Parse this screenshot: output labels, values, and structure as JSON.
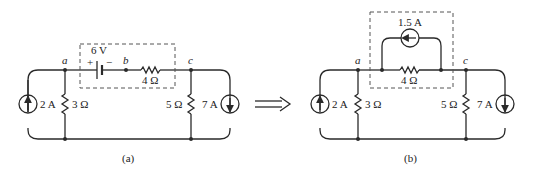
{
  "diagram": {
    "left": {
      "caption": "(a)",
      "nodes": {
        "a": "a",
        "b": "b",
        "c": "c"
      },
      "voltage_source": {
        "value": "6 V",
        "plus": "+",
        "minus": "−"
      },
      "series_resistor": "4 Ω",
      "current_source_left": "2 A",
      "resistor_left": "3 Ω",
      "resistor_right": "5 Ω",
      "current_source_right": "7 A"
    },
    "right": {
      "caption": "(b)",
      "nodes": {
        "a": "a",
        "c": "c"
      },
      "parallel_current_source": "1.5 A",
      "series_resistor": "4 Ω",
      "current_source_left": "2 A",
      "resistor_left": "3 Ω",
      "resistor_right": "5 Ω",
      "current_source_right": "7 A"
    },
    "transform_arrow": "double-arrow-right"
  }
}
